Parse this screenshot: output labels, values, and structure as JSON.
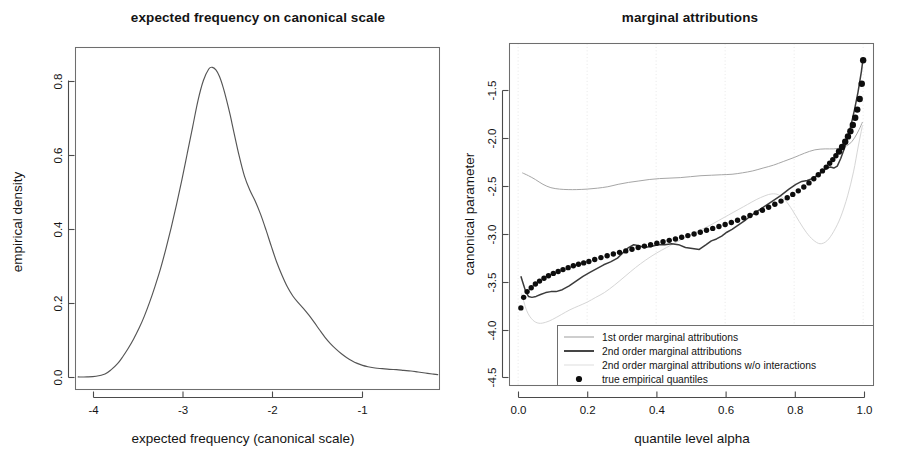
{
  "figure": {
    "width": 898,
    "height": 471,
    "background": "#ffffff",
    "panel_count": 2
  },
  "chart_data": [
    {
      "type": "line",
      "id": "density-panel",
      "title": "expected frequency on canonical scale",
      "xlabel": "expected frequency (canonical scale)",
      "ylabel": "empirical density",
      "xlim": [
        -4.45,
        -0.38
      ],
      "ylim": [
        -0.035,
        1.0
      ],
      "grid": false,
      "legend": "none",
      "xticks": [
        -4,
        -3,
        -2,
        -1
      ],
      "xtick_labels": [
        "-4",
        "-3",
        "-2",
        "-1"
      ],
      "yticks": [
        0.0,
        0.2,
        0.4,
        0.6,
        0.8
      ],
      "ytick_labels": [
        "0.0",
        "0.2",
        "0.4",
        "0.6",
        "0.8"
      ],
      "series": [
        {
          "name": "empirical density",
          "color": "#555555",
          "x": [
            -4.42,
            -4.32,
            -4.22,
            -4.12,
            -4.05,
            -3.98,
            -3.92,
            -3.86,
            -3.8,
            -3.74,
            -3.68,
            -3.62,
            -3.56,
            -3.5,
            -3.44,
            -3.38,
            -3.32,
            -3.26,
            -3.2,
            -3.14,
            -3.08,
            -3.02,
            -2.96,
            -2.92,
            -2.88,
            -2.84,
            -2.8,
            -2.76,
            -2.72,
            -2.68,
            -2.62,
            -2.56,
            -2.5,
            -2.44,
            -2.38,
            -2.32,
            -2.26,
            -2.2,
            -2.14,
            -2.08,
            -2.02,
            -1.96,
            -1.9,
            -1.84,
            -1.78,
            -1.72,
            -1.66,
            -1.6,
            -1.54,
            -1.48,
            -1.42,
            -1.36,
            -1.3,
            -1.24,
            -1.18,
            -1.1,
            -1.02,
            -0.94,
            -0.86,
            -0.78,
            -0.7,
            -0.62,
            -0.54,
            -0.46,
            -0.4
          ],
          "y": [
            0.003,
            0.003,
            0.005,
            0.012,
            0.025,
            0.043,
            0.065,
            0.09,
            0.118,
            0.15,
            0.187,
            0.23,
            0.278,
            0.33,
            0.39,
            0.455,
            0.525,
            0.6,
            0.68,
            0.76,
            0.84,
            0.9,
            0.935,
            0.94,
            0.932,
            0.912,
            0.88,
            0.84,
            0.795,
            0.745,
            0.672,
            0.61,
            0.568,
            0.535,
            0.495,
            0.448,
            0.398,
            0.35,
            0.31,
            0.275,
            0.248,
            0.228,
            0.21,
            0.19,
            0.168,
            0.145,
            0.123,
            0.104,
            0.088,
            0.074,
            0.062,
            0.052,
            0.044,
            0.038,
            0.034,
            0.03,
            0.028,
            0.026,
            0.025,
            0.023,
            0.021,
            0.018,
            0.015,
            0.012,
            0.01
          ]
        }
      ]
    },
    {
      "type": "line",
      "id": "attribution-panel",
      "title": "marginal attributions",
      "xlabel": "quantile level alpha",
      "ylabel": "canonical parameter",
      "xlim": [
        -0.025,
        1.03
      ],
      "ylim": [
        -4.62,
        -1.05
      ],
      "grid": true,
      "legend": "bottom-left-inside",
      "xticks": [
        0.0,
        0.2,
        0.4,
        0.6,
        0.8,
        1.0
      ],
      "xtick_labels": [
        "0.0",
        "0.2",
        "0.4",
        "0.6",
        "0.8",
        "1.0"
      ],
      "yticks": [
        -1.5,
        -2.0,
        -2.5,
        -3.0,
        -3.5,
        -4.0,
        -4.5
      ],
      "ytick_labels": [
        "-1.5",
        "-2.0",
        "-2.5",
        "-3.0",
        "-3.5",
        "-4.0",
        "-4.5"
      ],
      "series": [
        {
          "name": "1st order marginal attributions",
          "style": "thin-light-line",
          "color": "#a6a6a6",
          "x": [
            0.012,
            0.03,
            0.05,
            0.072,
            0.095,
            0.12,
            0.145,
            0.17,
            0.2,
            0.23,
            0.26,
            0.29,
            0.32,
            0.35,
            0.38,
            0.41,
            0.44,
            0.47,
            0.5,
            0.53,
            0.56,
            0.59,
            0.62,
            0.65,
            0.68,
            0.71,
            0.74,
            0.77,
            0.8,
            0.83,
            0.86,
            0.89,
            0.915,
            0.94,
            0.96,
            0.975,
            0.988,
            0.998
          ],
          "y": [
            -2.4,
            -2.43,
            -2.47,
            -2.52,
            -2.555,
            -2.57,
            -2.575,
            -2.575,
            -2.57,
            -2.56,
            -2.545,
            -2.52,
            -2.5,
            -2.485,
            -2.47,
            -2.46,
            -2.455,
            -2.45,
            -2.44,
            -2.43,
            -2.425,
            -2.42,
            -2.415,
            -2.4,
            -2.38,
            -2.35,
            -2.32,
            -2.28,
            -2.24,
            -2.195,
            -2.16,
            -2.15,
            -2.15,
            -2.135,
            -2.1,
            -2.035,
            -1.95,
            -1.87
          ]
        },
        {
          "name": "2nd order marginal attributions",
          "style": "thick-dark-line",
          "color": "#3b3b3b",
          "x": [
            0.008,
            0.015,
            0.022,
            0.03,
            0.04,
            0.052,
            0.065,
            0.08,
            0.095,
            0.11,
            0.128,
            0.148,
            0.168,
            0.188,
            0.208,
            0.228,
            0.248,
            0.268,
            0.288,
            0.305,
            0.32,
            0.335,
            0.35,
            0.365,
            0.385,
            0.405,
            0.425,
            0.445,
            0.465,
            0.485,
            0.505,
            0.525,
            0.545,
            0.56,
            0.575,
            0.59,
            0.605,
            0.62,
            0.64,
            0.66,
            0.685,
            0.71,
            0.735,
            0.76,
            0.785,
            0.805,
            0.822,
            0.838,
            0.852,
            0.866,
            0.88,
            0.895,
            0.905,
            0.915,
            0.925,
            0.935,
            0.945,
            0.955,
            0.965,
            0.975,
            0.985,
            0.995,
            1.0
          ],
          "y": [
            -3.48,
            -3.56,
            -3.64,
            -3.69,
            -3.7,
            -3.69,
            -3.67,
            -3.65,
            -3.64,
            -3.64,
            -3.62,
            -3.58,
            -3.53,
            -3.48,
            -3.44,
            -3.4,
            -3.36,
            -3.33,
            -3.29,
            -3.23,
            -3.18,
            -3.15,
            -3.16,
            -3.18,
            -3.17,
            -3.15,
            -3.15,
            -3.14,
            -3.15,
            -3.18,
            -3.19,
            -3.2,
            -3.15,
            -3.11,
            -3.09,
            -3.06,
            -3.02,
            -2.99,
            -2.94,
            -2.89,
            -2.82,
            -2.76,
            -2.7,
            -2.64,
            -2.57,
            -2.52,
            -2.49,
            -2.48,
            -2.46,
            -2.43,
            -2.39,
            -2.35,
            -2.34,
            -2.35,
            -2.33,
            -2.25,
            -2.15,
            -2.03,
            -1.9,
            -1.74,
            -1.56,
            -1.34,
            -1.2
          ]
        },
        {
          "name": "2nd order marginal attributions w/o interactions",
          "style": "very-light-line",
          "color": "#d6d6d6",
          "x": [
            0.01,
            0.025,
            0.042,
            0.06,
            0.08,
            0.1,
            0.125,
            0.15,
            0.175,
            0.2,
            0.225,
            0.25,
            0.28,
            0.31,
            0.34,
            0.37,
            0.4,
            0.43,
            0.46,
            0.49,
            0.52,
            0.55,
            0.58,
            0.61,
            0.64,
            0.665,
            0.69,
            0.715,
            0.735,
            0.755,
            0.775,
            0.795,
            0.815,
            0.835,
            0.855,
            0.875,
            0.895,
            0.915,
            0.935,
            0.955,
            0.972,
            0.986,
            0.998
          ],
          "y": [
            -3.66,
            -3.84,
            -3.935,
            -3.97,
            -3.96,
            -3.93,
            -3.88,
            -3.83,
            -3.79,
            -3.75,
            -3.7,
            -3.65,
            -3.57,
            -3.48,
            -3.39,
            -3.31,
            -3.24,
            -3.18,
            -3.12,
            -3.065,
            -3.01,
            -2.96,
            -2.9,
            -2.84,
            -2.78,
            -2.73,
            -2.68,
            -2.64,
            -2.62,
            -2.63,
            -2.69,
            -2.79,
            -2.91,
            -3.02,
            -3.1,
            -3.14,
            -3.11,
            -3.01,
            -2.86,
            -2.64,
            -2.39,
            -2.12,
            -1.905
          ]
        },
        {
          "name": "true empirical quantiles",
          "style": "filled-points",
          "color": "#0d0d0d",
          "x": [
            0.008,
            0.016,
            0.026,
            0.038,
            0.05,
            0.062,
            0.075,
            0.088,
            0.102,
            0.116,
            0.13,
            0.145,
            0.16,
            0.175,
            0.19,
            0.205,
            0.222,
            0.24,
            0.258,
            0.276,
            0.294,
            0.312,
            0.33,
            0.348,
            0.366,
            0.384,
            0.402,
            0.42,
            0.438,
            0.456,
            0.474,
            0.492,
            0.51,
            0.528,
            0.546,
            0.564,
            0.582,
            0.6,
            0.618,
            0.636,
            0.654,
            0.672,
            0.69,
            0.708,
            0.726,
            0.744,
            0.762,
            0.78,
            0.796,
            0.812,
            0.828,
            0.843,
            0.857,
            0.87,
            0.882,
            0.893,
            0.903,
            0.912,
            0.921,
            0.93,
            0.939,
            0.948,
            0.956,
            0.963,
            0.97,
            0.977,
            0.983,
            0.99,
            0.996,
            1.0
          ],
          "y": [
            -3.81,
            -3.7,
            -3.64,
            -3.6,
            -3.56,
            -3.53,
            -3.5,
            -3.475,
            -3.45,
            -3.43,
            -3.41,
            -3.39,
            -3.37,
            -3.355,
            -3.34,
            -3.325,
            -3.305,
            -3.285,
            -3.265,
            -3.248,
            -3.23,
            -3.215,
            -3.198,
            -3.18,
            -3.165,
            -3.15,
            -3.135,
            -3.12,
            -3.105,
            -3.09,
            -3.072,
            -3.055,
            -3.038,
            -3.02,
            -3.0,
            -2.98,
            -2.96,
            -2.94,
            -2.918,
            -2.895,
            -2.87,
            -2.845,
            -2.818,
            -2.79,
            -2.76,
            -2.728,
            -2.695,
            -2.66,
            -2.625,
            -2.588,
            -2.548,
            -2.505,
            -2.462,
            -2.42,
            -2.38,
            -2.34,
            -2.3,
            -2.262,
            -2.222,
            -2.178,
            -2.13,
            -2.075,
            -2.02,
            -1.965,
            -1.9,
            -1.825,
            -1.74,
            -1.63,
            -1.47,
            -1.225
          ]
        }
      ]
    }
  ],
  "left_panel": {
    "title": "expected frequency on canonical scale",
    "x_axis_label": "expected frequency (canonical scale)",
    "y_axis_label": "empirical density",
    "x_ticks": [
      "-4",
      "-3",
      "-2",
      "-1"
    ],
    "y_ticks": [
      "0.8",
      "0.6",
      "0.4",
      "0.2",
      "0.0"
    ]
  },
  "right_panel": {
    "title": "marginal attributions",
    "x_axis_label": "quantile level alpha",
    "y_axis_label": "canonical parameter",
    "x_ticks": [
      "0.0",
      "0.2",
      "0.4",
      "0.6",
      "0.8",
      "1.0"
    ],
    "y_ticks": [
      "-1.5",
      "-2.0",
      "-2.5",
      "-3.0",
      "-3.5",
      "-4.0",
      "-4.5"
    ],
    "legend": {
      "entries": [
        {
          "label": "1st order marginal attributions",
          "marker": "line-light"
        },
        {
          "label": "2nd order marginal attributions",
          "marker": "line-dark"
        },
        {
          "label": "2nd order marginal attributions w/o interactions",
          "marker": "line-very-light"
        },
        {
          "label": "true empirical quantiles",
          "marker": "dot"
        }
      ]
    }
  },
  "colors": {
    "background": "#ffffff",
    "axis": "#4a4a4a",
    "box": "#6e6e6e",
    "density": "#555555",
    "first_order": "#a6a6a6",
    "second_order": "#3b3b3b",
    "no_interactions": "#d6d6d6",
    "quantile_points": "#0d0d0d",
    "grid": "#e2e2e2"
  }
}
